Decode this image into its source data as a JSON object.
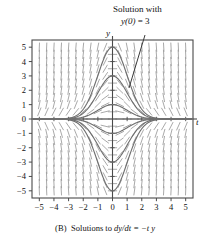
{
  "figure": {
    "caption_label": "(B)",
    "caption_text": "Solutions to",
    "caption_equation": "dy/dt = −t y",
    "annotation": {
      "line1": "Solution with",
      "line2_math": "y(0)",
      "line2_rest": " = 3"
    }
  },
  "chart_data": {
    "type": "line",
    "title": "",
    "subtitle": "",
    "xlabel": "t",
    "ylabel": "y",
    "xlim": [
      -5.5,
      5.5
    ],
    "ylim": [
      -5.5,
      5.5
    ],
    "xticks": [
      -5,
      -4,
      -3,
      -2,
      -1,
      0,
      1,
      2,
      3,
      4,
      5
    ],
    "yticks": [
      5,
      4,
      3,
      2,
      1,
      0,
      -1,
      -2,
      -3,
      -4,
      -5
    ],
    "xticklabels": [
      "−5",
      "−4",
      "−3",
      "−2",
      "−1",
      "0",
      "1",
      "2",
      "3",
      "4",
      "5"
    ],
    "yticklabels": [
      "5",
      "4",
      "3",
      "2",
      "1",
      "0",
      "−1",
      "−2",
      "−3",
      "−4",
      "−5"
    ],
    "grid": false,
    "legend": "none",
    "equation": "dy/dt = -t*y",
    "solution_form": "y = C*exp(-t^2/2)",
    "series": [
      {
        "name": "y(0) = 5",
        "C": 5
      },
      {
        "name": "y(0) = 3",
        "C": 3
      },
      {
        "name": "y(0) = 1",
        "C": 1
      },
      {
        "name": "y(0) = 0",
        "C": 0
      },
      {
        "name": "y(0) = -1",
        "C": -1
      },
      {
        "name": "y(0) = -3",
        "C": -3
      },
      {
        "name": "y(0) = -5",
        "C": -5
      }
    ],
    "annotations": [
      {
        "text": "Solution with y(0) = 3",
        "points_to_curve_C": 3,
        "leader_from": [
          145,
          35
        ],
        "leader_to": [
          129,
          88
        ]
      }
    ],
    "slope_field": {
      "shown": true,
      "t_range": [
        -5,
        5
      ],
      "y_range": [
        -5,
        5
      ],
      "t_step": 0.5,
      "y_step": 0.5,
      "color": "#9a9a9a"
    },
    "colors": {
      "curve": "#6f6f6f",
      "axis": "#4a4a4a",
      "frame": "#4a4a4a",
      "slope_field": "#9a9a9a",
      "text": "#111111",
      "background": "#ffffff"
    }
  }
}
